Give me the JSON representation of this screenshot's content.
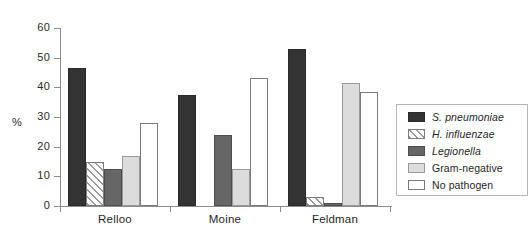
{
  "chart_data": {
    "type": "bar",
    "title": "",
    "xlabel": "",
    "ylabel": "%",
    "ylim": [
      0,
      60
    ],
    "yticks": [
      0,
      10,
      20,
      30,
      40,
      50,
      60
    ],
    "grid": false,
    "legend_position": "right",
    "categories": [
      "Relloo",
      "Moine",
      "Feldman"
    ],
    "series": [
      {
        "name": "S. pneumoniae",
        "italic": true,
        "swatch": "dark",
        "values": [
          46.5,
          37.5,
          52.8
        ]
      },
      {
        "name": "H. influenzae",
        "italic": true,
        "swatch": "hatch",
        "values": [
          14.7,
          0,
          3.0
        ]
      },
      {
        "name": "Legionella",
        "italic": true,
        "swatch": "mid",
        "values": [
          12.5,
          24.0,
          1.0
        ]
      },
      {
        "name": "Gram-negative",
        "italic": false,
        "swatch": "light",
        "values": [
          17.0,
          12.5,
          41.3
        ]
      },
      {
        "name": "No pathogen",
        "italic": false,
        "swatch": "white",
        "values": [
          28.0,
          43.0,
          38.3
        ]
      }
    ]
  },
  "colors": {
    "dark": "#333333",
    "hatch": "#9a9a9a",
    "mid": "#666666",
    "light": "#dcdcdc",
    "white": "#ffffff",
    "axis": "#8c8c8c"
  }
}
